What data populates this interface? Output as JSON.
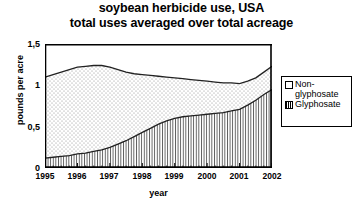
{
  "title": {
    "line1": "soybean herbicide use, USA",
    "line2": "total uses averaged over total acreage"
  },
  "axes": {
    "ylabel": "pounds per acre",
    "xlabel": "year",
    "yticks": [
      "0",
      "0,5",
      "1",
      "1,5"
    ],
    "xticks": [
      "1995",
      "1996",
      "1997",
      "1998",
      "1999",
      "2000",
      "2001",
      "2002"
    ]
  },
  "legend": {
    "items": [
      {
        "label": "Non-\nglyphosate",
        "pattern": "dotted",
        "swatch_name": "legend-swatch-non-glyphosate"
      },
      {
        "label": "Glyphosate",
        "pattern": "vertical-hatch",
        "swatch_name": "legend-swatch-glyphosate"
      }
    ]
  },
  "colors": {
    "axis": "#000000",
    "line": "#222222",
    "fill_background": "#ffffff"
  },
  "chart_data": {
    "type": "area",
    "title": "soybean herbicide use, USA total uses averaged over total acreage",
    "xlabel": "year",
    "ylabel": "pounds per acre",
    "xlim": [
      1995,
      2002
    ],
    "ylim": [
      0,
      1.5
    ],
    "yticks": [
      0,
      0.5,
      1,
      1.5
    ],
    "grid": false,
    "stacked": true,
    "legend_position": "right",
    "x": [
      1995.0,
      1995.25,
      1995.5,
      1995.75,
      1996.0,
      1996.25,
      1996.5,
      1996.75,
      1997.0,
      1997.25,
      1997.5,
      1997.75,
      1998.0,
      1998.25,
      1998.5,
      1998.75,
      1999.0,
      1999.25,
      1999.5,
      1999.75,
      2000.0,
      2000.25,
      2000.5,
      2000.75,
      2001.0,
      2001.25,
      2001.5,
      2001.75,
      2002.0
    ],
    "series": [
      {
        "name": "Glyphosate",
        "pattern": "vertical-hatch",
        "values": [
          0.12,
          0.13,
          0.14,
          0.15,
          0.17,
          0.18,
          0.2,
          0.22,
          0.25,
          0.29,
          0.33,
          0.38,
          0.43,
          0.48,
          0.53,
          0.57,
          0.6,
          0.62,
          0.63,
          0.64,
          0.65,
          0.66,
          0.67,
          0.69,
          0.71,
          0.76,
          0.82,
          0.89,
          0.95
        ]
      },
      {
        "name": "Non-glyphosate",
        "pattern": "dotted",
        "values": [
          0.98,
          1.0,
          1.02,
          1.04,
          1.05,
          1.05,
          1.04,
          1.02,
          0.97,
          0.9,
          0.83,
          0.76,
          0.7,
          0.64,
          0.58,
          0.53,
          0.49,
          0.46,
          0.44,
          0.42,
          0.4,
          0.38,
          0.36,
          0.34,
          0.31,
          0.29,
          0.27,
          0.27,
          0.28
        ]
      }
    ],
    "total": {
      "name": "total uses",
      "values": [
        1.1,
        1.13,
        1.16,
        1.19,
        1.22,
        1.23,
        1.24,
        1.24,
        1.22,
        1.19,
        1.16,
        1.14,
        1.13,
        1.12,
        1.11,
        1.1,
        1.09,
        1.08,
        1.07,
        1.06,
        1.05,
        1.04,
        1.03,
        1.03,
        1.02,
        1.05,
        1.09,
        1.16,
        1.23
      ]
    }
  }
}
